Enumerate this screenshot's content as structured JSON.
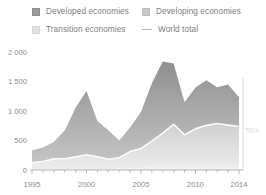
{
  "legend": {
    "items": [
      {
        "key": "developed",
        "label": "Developed economies",
        "marker": "square",
        "color": "#9a9a9a"
      },
      {
        "key": "developing",
        "label": "Developing economies",
        "marker": "square",
        "color": "#c9c9c9"
      },
      {
        "key": "transition",
        "label": "Transition economies",
        "marker": "square",
        "color": "#e2e2e2"
      },
      {
        "key": "world",
        "label": "World total",
        "marker": "line",
        "color": "#b4b4b4"
      }
    ]
  },
  "axes": {
    "y_ticks": [
      "0",
      "500",
      "1 000",
      "1 500",
      "2 000"
    ],
    "x_ticks": [
      "1995",
      "2000",
      "2005",
      "2010",
      "2014"
    ]
  },
  "annotation": {
    "right_label": "55%"
  },
  "chart_data": {
    "type": "area",
    "stacked": true,
    "title": "",
    "subtitle": "",
    "xlabel": "",
    "ylabel": "",
    "xlim": [
      1995,
      2014
    ],
    "ylim": [
      0,
      2000
    ],
    "grid": false,
    "legend_position": "top",
    "x": [
      1995,
      1996,
      1997,
      1998,
      1999,
      2000,
      2001,
      2002,
      2003,
      2004,
      2005,
      2006,
      2007,
      2008,
      2009,
      2010,
      2011,
      2012,
      2013,
      2014
    ],
    "categories": [
      "1995",
      "1996",
      "1997",
      "1998",
      "1999",
      "2000",
      "2001",
      "2002",
      "2003",
      "2004",
      "2005",
      "2006",
      "2007",
      "2008",
      "2009",
      "2010",
      "2011",
      "2012",
      "2013",
      "2014"
    ],
    "series": [
      {
        "name": "Transition economies",
        "color": "#e8e8e8",
        "values": [
          8,
          10,
          14,
          10,
          10,
          8,
          10,
          12,
          22,
          32,
          34,
          60,
          95,
          125,
          75,
          77,
          97,
          87,
          100,
          57
        ]
      },
      {
        "name": "Developing economies",
        "color": "#c9c9c9",
        "values": [
          117,
          135,
          175,
          180,
          215,
          250,
          215,
          170,
          185,
          280,
          330,
          430,
          530,
          650,
          520,
          620,
          660,
          700,
          660,
          680
        ]
      },
      {
        "name": "Developed economies",
        "color": "#9a9a9a",
        "values": [
          205,
          235,
          285,
          480,
          830,
          1080,
          605,
          490,
          295,
          410,
          620,
          980,
          1215,
          1030,
          555,
          700,
          765,
          615,
          690,
          495
        ]
      }
    ],
    "overlay_line": {
      "name": "World total",
      "color": "#f7f7f7",
      "note": "white line drawn at top of the Developing economies band",
      "values": [
        125,
        145,
        189,
        190,
        225,
        258,
        225,
        182,
        207,
        312,
        364,
        490,
        625,
        775,
        595,
        697,
        757,
        787,
        760,
        737
      ]
    },
    "world_total": [
      330,
      380,
      474,
      670,
      1055,
      1338,
      830,
      672,
      502,
      722,
      984,
      1470,
      1840,
      1805,
      1150,
      1397,
      1522,
      1402,
      1450,
      1232
    ]
  }
}
